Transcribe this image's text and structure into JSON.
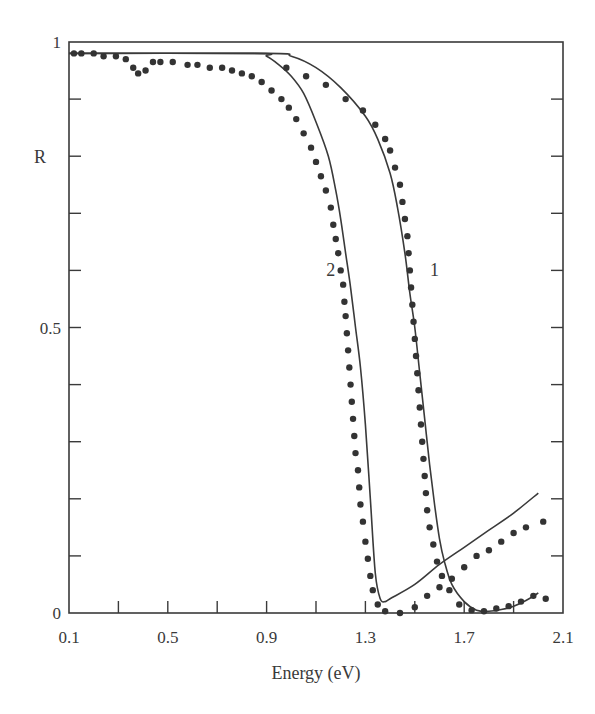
{
  "chart_data": {
    "type": "line",
    "title": "",
    "xlabel": "Energy (eV)",
    "ylabel": "R",
    "xlim": [
      0.1,
      2.1
    ],
    "ylim": [
      0,
      1
    ],
    "x_ticks": [
      0.1,
      0.3,
      0.5,
      0.7,
      0.9,
      1.1,
      1.3,
      1.5,
      1.7,
      1.9,
      2.1
    ],
    "x_tick_labels": [
      {
        "value": 0.1,
        "label": "0.1"
      },
      {
        "value": 0.5,
        "label": "0.5"
      },
      {
        "value": 0.9,
        "label": "0.9"
      },
      {
        "value": 1.3,
        "label": "1.3"
      },
      {
        "value": 1.7,
        "label": "1.7"
      },
      {
        "value": 2.1,
        "label": "2.1"
      }
    ],
    "y_ticks": [
      0,
      0.1,
      0.2,
      0.3,
      0.4,
      0.5,
      0.6,
      0.7,
      0.8,
      0.9,
      1.0
    ],
    "y_tick_labels": [
      {
        "value": 0,
        "label": "0"
      },
      {
        "value": 0.5,
        "label": "0.5"
      },
      {
        "value": 1.0,
        "label": "1"
      }
    ],
    "grid": false,
    "legend": "none (curves labeled inline)",
    "annotations": [
      {
        "text": "2",
        "x": 1.16,
        "y": 0.6
      },
      {
        "text": "1",
        "x": 1.58,
        "y": 0.6
      }
    ],
    "series": [
      {
        "name": "1 (theory)",
        "style": "solid",
        "points": [
          [
            0.1,
            0.98
          ],
          [
            0.9,
            0.98
          ],
          [
            1.0,
            0.975
          ],
          [
            1.1,
            0.955
          ],
          [
            1.2,
            0.92
          ],
          [
            1.3,
            0.87
          ],
          [
            1.35,
            0.83
          ],
          [
            1.4,
            0.77
          ],
          [
            1.43,
            0.71
          ],
          [
            1.46,
            0.63
          ],
          [
            1.48,
            0.56
          ],
          [
            1.5,
            0.5
          ],
          [
            1.52,
            0.42
          ],
          [
            1.54,
            0.34
          ],
          [
            1.56,
            0.26
          ],
          [
            1.58,
            0.19
          ],
          [
            1.6,
            0.13
          ],
          [
            1.62,
            0.09
          ],
          [
            1.65,
            0.05
          ],
          [
            1.7,
            0.02
          ],
          [
            1.75,
            0.005
          ],
          [
            1.8,
            0.003
          ],
          [
            1.85,
            0.006
          ],
          [
            1.9,
            0.012
          ],
          [
            1.95,
            0.022
          ],
          [
            2.0,
            0.035
          ]
        ]
      },
      {
        "name": "2 (theory)",
        "style": "solid",
        "points": [
          [
            0.1,
            0.98
          ],
          [
            0.85,
            0.98
          ],
          [
            0.9,
            0.975
          ],
          [
            0.95,
            0.96
          ],
          [
            1.0,
            0.94
          ],
          [
            1.05,
            0.91
          ],
          [
            1.1,
            0.86
          ],
          [
            1.15,
            0.8
          ],
          [
            1.18,
            0.74
          ],
          [
            1.2,
            0.69
          ],
          [
            1.22,
            0.63
          ],
          [
            1.24,
            0.57
          ],
          [
            1.26,
            0.5
          ],
          [
            1.28,
            0.43
          ],
          [
            1.3,
            0.33
          ],
          [
            1.32,
            0.2
          ],
          [
            1.34,
            0.07
          ],
          [
            1.36,
            0.025
          ],
          [
            1.38,
            0.02
          ],
          [
            1.4,
            0.025
          ],
          [
            1.5,
            0.05
          ],
          [
            1.6,
            0.085
          ],
          [
            1.7,
            0.115
          ],
          [
            1.8,
            0.145
          ],
          [
            1.9,
            0.175
          ],
          [
            2.0,
            0.21
          ]
        ]
      },
      {
        "name": "1 (experiment)",
        "style": "dots",
        "points": [
          [
            0.98,
            0.955
          ],
          [
            1.06,
            0.94
          ],
          [
            1.14,
            0.925
          ],
          [
            1.22,
            0.9
          ],
          [
            1.29,
            0.88
          ],
          [
            1.34,
            0.855
          ],
          [
            1.38,
            0.83
          ],
          [
            1.4,
            0.81
          ],
          [
            1.42,
            0.78
          ],
          [
            1.44,
            0.75
          ],
          [
            1.45,
            0.72
          ],
          [
            1.46,
            0.69
          ],
          [
            1.47,
            0.66
          ],
          [
            1.475,
            0.63
          ],
          [
            1.48,
            0.6
          ],
          [
            1.485,
            0.57
          ],
          [
            1.49,
            0.54
          ],
          [
            1.495,
            0.51
          ],
          [
            1.5,
            0.48
          ],
          [
            1.505,
            0.45
          ],
          [
            1.51,
            0.42
          ],
          [
            1.515,
            0.39
          ],
          [
            1.52,
            0.36
          ],
          [
            1.525,
            0.33
          ],
          [
            1.53,
            0.3
          ],
          [
            1.535,
            0.27
          ],
          [
            1.54,
            0.24
          ],
          [
            1.545,
            0.21
          ],
          [
            1.55,
            0.18
          ],
          [
            1.56,
            0.15
          ],
          [
            1.575,
            0.12
          ],
          [
            1.59,
            0.09
          ],
          [
            1.61,
            0.065
          ],
          [
            1.64,
            0.04
          ],
          [
            1.68,
            0.015
          ],
          [
            1.73,
            0.005
          ],
          [
            1.78,
            0.003
          ],
          [
            1.83,
            0.008
          ],
          [
            1.88,
            0.012
          ],
          [
            1.93,
            0.02
          ],
          [
            1.98,
            0.03
          ],
          [
            2.03,
            0.025
          ]
        ]
      },
      {
        "name": "2 (experiment)",
        "style": "dots",
        "points": [
          [
            0.12,
            0.98
          ],
          [
            0.15,
            0.98
          ],
          [
            0.2,
            0.98
          ],
          [
            0.24,
            0.975
          ],
          [
            0.29,
            0.975
          ],
          [
            0.33,
            0.97
          ],
          [
            0.36,
            0.955
          ],
          [
            0.38,
            0.945
          ],
          [
            0.41,
            0.95
          ],
          [
            0.44,
            0.965
          ],
          [
            0.47,
            0.965
          ],
          [
            0.52,
            0.965
          ],
          [
            0.58,
            0.96
          ],
          [
            0.62,
            0.96
          ],
          [
            0.67,
            0.955
          ],
          [
            0.72,
            0.955
          ],
          [
            0.76,
            0.95
          ],
          [
            0.8,
            0.945
          ],
          [
            0.84,
            0.94
          ],
          [
            0.88,
            0.93
          ],
          [
            0.92,
            0.915
          ],
          [
            0.96,
            0.9
          ],
          [
            0.99,
            0.885
          ],
          [
            1.02,
            0.865
          ],
          [
            1.05,
            0.84
          ],
          [
            1.08,
            0.815
          ],
          [
            1.1,
            0.79
          ],
          [
            1.12,
            0.765
          ],
          [
            1.14,
            0.74
          ],
          [
            1.16,
            0.71
          ],
          [
            1.17,
            0.68
          ],
          [
            1.18,
            0.655
          ],
          [
            1.19,
            0.63
          ],
          [
            1.2,
            0.6
          ],
          [
            1.21,
            0.575
          ],
          [
            1.215,
            0.545
          ],
          [
            1.22,
            0.52
          ],
          [
            1.225,
            0.49
          ],
          [
            1.23,
            0.46
          ],
          [
            1.235,
            0.43
          ],
          [
            1.24,
            0.4
          ],
          [
            1.245,
            0.37
          ],
          [
            1.25,
            0.34
          ],
          [
            1.255,
            0.31
          ],
          [
            1.26,
            0.28
          ],
          [
            1.27,
            0.25
          ],
          [
            1.275,
            0.22
          ],
          [
            1.28,
            0.19
          ],
          [
            1.29,
            0.16
          ],
          [
            1.3,
            0.125
          ],
          [
            1.31,
            0.095
          ],
          [
            1.32,
            0.065
          ],
          [
            1.33,
            0.04
          ],
          [
            1.35,
            0.015
          ],
          [
            1.38,
            0.003
          ],
          [
            1.44,
            0.0
          ],
          [
            1.5,
            0.01
          ],
          [
            1.55,
            0.03
          ],
          [
            1.6,
            0.045
          ],
          [
            1.65,
            0.06
          ],
          [
            1.7,
            0.08
          ],
          [
            1.75,
            0.1
          ],
          [
            1.8,
            0.11
          ],
          [
            1.85,
            0.125
          ],
          [
            1.9,
            0.14
          ],
          [
            1.95,
            0.15
          ],
          [
            2.02,
            0.16
          ]
        ]
      }
    ]
  }
}
